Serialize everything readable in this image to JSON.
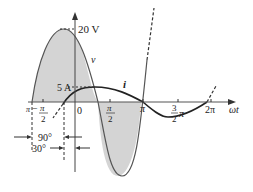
{
  "diagram": {
    "voltage": {
      "label": "v",
      "peak_label": "20 V"
    },
    "current": {
      "label": "i",
      "peak_label": "5 A"
    },
    "axis": {
      "x_label": "ωt",
      "origin_label": "0"
    },
    "ticks": {
      "neg_half_pi_num": "π",
      "neg_half_pi_den": "2",
      "neg_sign": "−",
      "half_pi_num": "π",
      "half_pi_den": "2",
      "pi": "π",
      "three_half_pi_num": "3",
      "three_half_pi_den": "2",
      "three_half_pi_sym": "π",
      "two_pi": "2π",
      "left_pi": "π"
    },
    "annotations": {
      "angle_90": "90°",
      "angle_30": "30°"
    },
    "colors": {
      "fill": "#d4d4d4",
      "stroke": "#555555",
      "current": "#222222"
    }
  }
}
